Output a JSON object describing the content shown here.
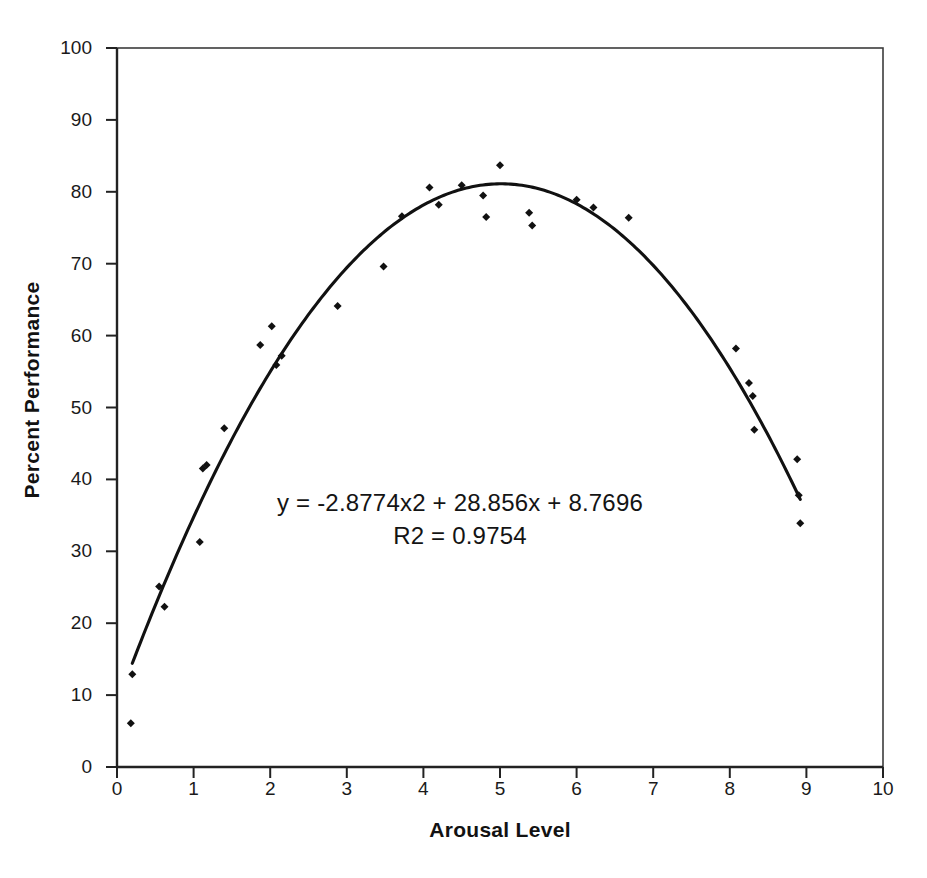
{
  "chart_data": {
    "type": "scatter",
    "title": "",
    "subtitle": "",
    "xlabel": "Arousal Level",
    "ylabel": "Percent Performance",
    "xlim": [
      0,
      10
    ],
    "ylim": [
      0,
      100
    ],
    "xticks": [
      "0",
      "1",
      "2",
      "3",
      "4",
      "5",
      "6",
      "7",
      "8",
      "9",
      "10"
    ],
    "yticks": [
      "0",
      "10",
      "20",
      "30",
      "40",
      "50",
      "60",
      "70",
      "80",
      "90",
      "100"
    ],
    "xtick_values": [
      0,
      1,
      2,
      3,
      4,
      5,
      6,
      7,
      8,
      9,
      10
    ],
    "ytick_values": [
      0,
      10,
      20,
      30,
      40,
      50,
      60,
      70,
      80,
      90,
      100
    ],
    "grid": false,
    "legend": "none",
    "marker": "filled-diamond",
    "marker_color": "#111111",
    "line_color": "#111111",
    "axis_color": "#3c3c3c",
    "background": "#ffffff",
    "series": [
      {
        "name": "Observations",
        "type": "scatter",
        "points": [
          [
            0.18,
            6.1
          ],
          [
            0.2,
            12.9
          ],
          [
            0.55,
            25.1
          ],
          [
            0.62,
            22.3
          ],
          [
            1.08,
            31.3
          ],
          [
            1.12,
            41.5
          ],
          [
            1.17,
            42.0
          ],
          [
            1.4,
            47.1
          ],
          [
            1.87,
            58.7
          ],
          [
            2.02,
            61.3
          ],
          [
            2.08,
            55.9
          ],
          [
            2.15,
            57.2
          ],
          [
            2.88,
            64.1
          ],
          [
            3.48,
            69.6
          ],
          [
            3.72,
            76.6
          ],
          [
            4.08,
            80.6
          ],
          [
            4.2,
            78.2
          ],
          [
            4.5,
            80.9
          ],
          [
            4.78,
            79.5
          ],
          [
            4.82,
            76.5
          ],
          [
            5.0,
            83.7
          ],
          [
            5.38,
            77.1
          ],
          [
            5.42,
            75.3
          ],
          [
            6.0,
            78.9
          ],
          [
            6.22,
            77.8
          ],
          [
            6.68,
            76.4
          ],
          [
            8.08,
            58.2
          ],
          [
            8.25,
            53.4
          ],
          [
            8.3,
            51.6
          ],
          [
            8.32,
            46.9
          ],
          [
            8.88,
            42.8
          ],
          [
            8.9,
            37.8
          ],
          [
            8.92,
            33.9
          ]
        ]
      },
      {
        "name": "Quadratic trendline",
        "type": "line",
        "equation": "y = -2.8774x^2 + 28.856x + 8.7696",
        "coefficients": {
          "a": -2.8774,
          "b": 28.856,
          "c": 8.7696
        },
        "r_squared": 0.9754,
        "x_range": [
          0.2,
          8.92
        ]
      }
    ],
    "annotations": [
      {
        "name": "trendline-equation",
        "line1": "y = -2.8774x2 + 28.856x + 8.7696",
        "line2": "R2 = 0.9754"
      }
    ]
  },
  "axes": {
    "x_title": "Arousal Level",
    "y_title": "Percent Performance"
  },
  "annotation": {
    "equation": "y = -2.8774x2 + 28.856x + 8.7696",
    "r_squared": "R2 = 0.9754"
  }
}
